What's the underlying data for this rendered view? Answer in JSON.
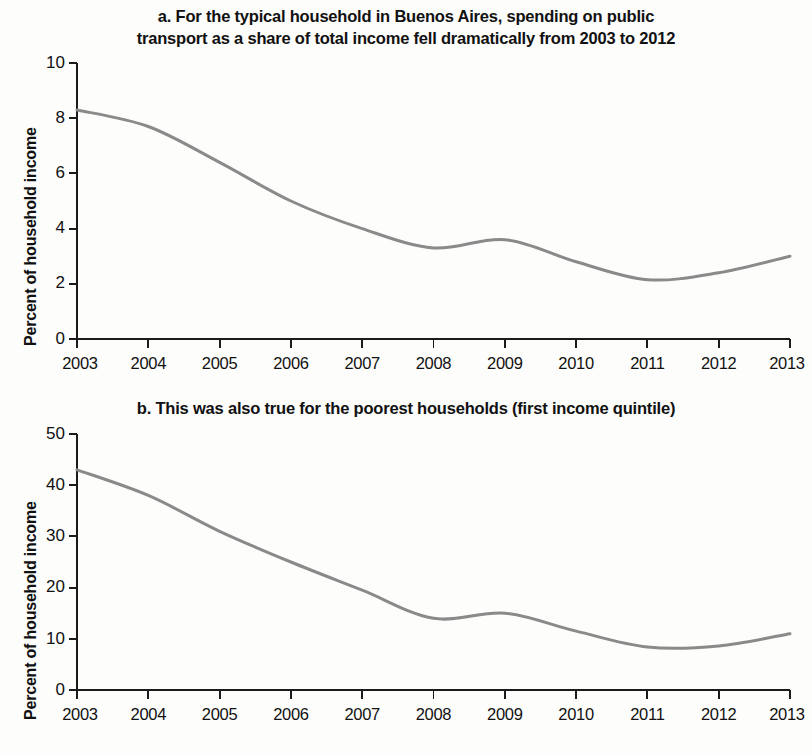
{
  "document": {
    "background_color": "#fdfdfc",
    "text_color": "#111111"
  },
  "panels": {
    "a": {
      "title": "a. For the typical household in Buenos Aires, spending on public transport as a share of total income fell dramatically from 2003 to 2012",
      "title_line1": "a. For the typical household in Buenos Aires, spending on public",
      "title_line2": "transport as a share of total income fell dramatically from 2003 to 2012",
      "y_axis_label": "Percent of household income"
    },
    "b": {
      "title": "b. This was also true for the poorest households (first income quintile)",
      "y_axis_label": "Percent of household income"
    }
  },
  "chart_data": [
    {
      "id": "chart-a",
      "type": "line",
      "title": "a. For the typical household in Buenos Aires, spending on public transport as a share of total income fell dramatically from 2003 to 2012",
      "xlabel": "",
      "ylabel": "Percent of household income",
      "x": [
        2003,
        2004,
        2005,
        2006,
        2007,
        2008,
        2009,
        2010,
        2011,
        2012,
        2013
      ],
      "xticklabels": [
        "2003",
        "2004",
        "2005",
        "2006",
        "2007",
        "2008",
        "2009",
        "2010",
        "2011",
        "2012",
        "2013"
      ],
      "yticks": [
        0,
        2,
        4,
        6,
        8,
        10
      ],
      "yticklabels": [
        "0",
        "2",
        "4",
        "6",
        "8",
        "10"
      ],
      "xlim": [
        2003,
        2013
      ],
      "ylim": [
        0,
        10
      ],
      "grid": false,
      "legend": false,
      "line_color": "#8a8a8a",
      "line_width": 3,
      "series": [
        {
          "name": "Percent of household income (typical household)",
          "values": [
            8.3,
            7.7,
            6.4,
            5.0,
            4.0,
            3.3,
            3.6,
            2.8,
            2.15,
            2.4,
            3.0
          ]
        }
      ]
    },
    {
      "id": "chart-b",
      "type": "line",
      "title": "b. This was also true for the poorest households (first income quintile)",
      "xlabel": "",
      "ylabel": "Percent of household income",
      "x": [
        2003,
        2004,
        2005,
        2006,
        2007,
        2008,
        2009,
        2010,
        2011,
        2012,
        2013
      ],
      "xticklabels": [
        "2003",
        "2004",
        "2005",
        "2006",
        "2007",
        "2008",
        "2009",
        "2010",
        "2011",
        "2012",
        "2013"
      ],
      "yticks": [
        0,
        10,
        20,
        30,
        40,
        50
      ],
      "yticklabels": [
        "0",
        "10",
        "20",
        "30",
        "40",
        "50"
      ],
      "xlim": [
        2003,
        2013
      ],
      "ylim": [
        0,
        50
      ],
      "grid": false,
      "legend": false,
      "line_color": "#8a8a8a",
      "line_width": 3,
      "series": [
        {
          "name": "Percent of household income (first income quintile)",
          "values": [
            43.0,
            38.0,
            31.0,
            25.0,
            19.5,
            14.0,
            15.0,
            11.5,
            8.4,
            8.6,
            11.0
          ]
        }
      ]
    }
  ]
}
